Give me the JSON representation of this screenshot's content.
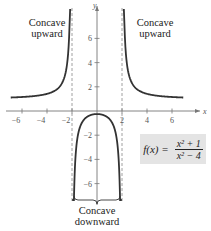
{
  "chart_data": {
    "type": "line",
    "title": "",
    "function_label": "f(x) = (x^2 + 1)/(x^2 - 4)",
    "function": {
      "name": "f(x)",
      "numerator": "x² + 1",
      "denominator": "x² − 4"
    },
    "xlabel": "x",
    "ylabel": "y",
    "xlim": [
      -7.5,
      7.5
    ],
    "ylim": [
      -7.5,
      7.5
    ],
    "x_ticks": [
      -6,
      -4,
      -2,
      2,
      4,
      6
    ],
    "y_ticks": [
      -6,
      -4,
      -2,
      2,
      4,
      6
    ],
    "vertical_asymptotes": [
      -2,
      2
    ],
    "horizontal_asymptote": 1,
    "grid": false,
    "series": [
      {
        "name": "left branch",
        "x": [
          -6,
          -5,
          -4,
          -3,
          -2.5,
          -2.2
        ],
        "y": [
          1.16,
          1.24,
          1.42,
          2.0,
          3.25,
          6.95
        ]
      },
      {
        "name": "middle branch",
        "x": [
          -1.9,
          -1.5,
          -1,
          0,
          1,
          1.5,
          1.9
        ],
        "y": [
          -11.8,
          -1.86,
          -0.67,
          -0.25,
          -0.67,
          -1.86,
          -11.8
        ]
      },
      {
        "name": "right branch",
        "x": [
          2.2,
          2.5,
          3,
          4,
          5,
          6
        ],
        "y": [
          6.95,
          3.25,
          2.0,
          1.42,
          1.24,
          1.16
        ]
      }
    ],
    "annotations": [
      {
        "text": "Concave upward",
        "region": "x < -2"
      },
      {
        "text": "Concave upward",
        "region": "x > 2"
      },
      {
        "text": "Concave downward",
        "region": "-2 < x < 2"
      }
    ]
  },
  "labels": {
    "left_top": "Concave",
    "left_bottom": "upward",
    "right_top": "Concave",
    "right_bottom": "upward",
    "mid_top": "Concave",
    "mid_bottom": "downward",
    "fx": "f(x) =",
    "num": "x² + 1",
    "den": "x² − 4"
  },
  "axes": {
    "x_name": "x",
    "y_name": "y",
    "xticks": [
      "−6",
      "−4",
      "−2",
      "2",
      "4",
      "6"
    ],
    "yticks": [
      "6",
      "4",
      "2",
      "−2",
      "−4",
      "−6"
    ]
  },
  "colors": {
    "curve": "#333333",
    "axis": "#777777",
    "asymptote": "#888888",
    "formula_bg": "#e4e4e4"
  }
}
